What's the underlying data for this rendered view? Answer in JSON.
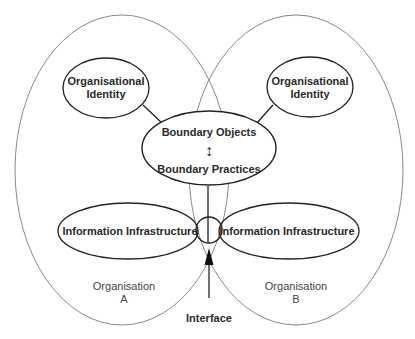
{
  "diagram": {
    "organisations": [
      {
        "label_line1": "Organisation",
        "label_line2": "A"
      },
      {
        "label_line1": "Organisation",
        "label_line2": "B"
      }
    ],
    "identity_nodes": [
      {
        "line1": "Organisational",
        "line2": "Identity"
      },
      {
        "line1": "Organisational",
        "line2": "Identity"
      }
    ],
    "boundary_node": {
      "top": "Boundary Objects",
      "arrow": "↕",
      "bottom": "Boundary Practices"
    },
    "infrastructure_nodes": [
      {
        "label": "Information Infrastructure"
      },
      {
        "label": "Information Infrastructure"
      }
    ],
    "interface_label": "Interface",
    "colors": {
      "organisation_outline": "#8a8a8a",
      "node_outline": "#222222",
      "text": "#2a2a2a"
    }
  }
}
